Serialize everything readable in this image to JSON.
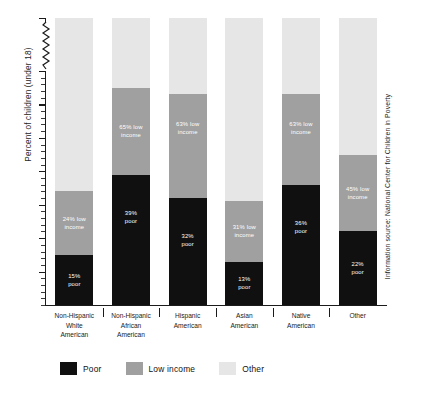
{
  "axis": {
    "y_title": "Percent of children (under 18)",
    "y_ticks": [
      "100%",
      "70%",
      "60%",
      "50%",
      "40%",
      "30%",
      "20%",
      "10%"
    ]
  },
  "legend": {
    "items": [
      {
        "label": "Poor",
        "color": "#101010",
        "key": "poor"
      },
      {
        "label": "Low income",
        "color": "#a0a0a0",
        "key": "low"
      },
      {
        "label": "Other",
        "color": "#e6e6e6",
        "key": "other"
      }
    ]
  },
  "source": {
    "text": "Information source: National Center for Children in Poverty"
  },
  "categories": [
    {
      "lines": [
        "Non-Hispanic",
        "White",
        "American"
      ]
    },
    {
      "lines": [
        "Non-Hispanic",
        "African",
        "American"
      ]
    },
    {
      "lines": [
        "Hispanic",
        "American"
      ]
    },
    {
      "lines": [
        "Asian",
        "American"
      ]
    },
    {
      "lines": [
        "Native",
        "American"
      ]
    },
    {
      "lines": [
        "Other"
      ]
    }
  ],
  "bar_labels": [
    {
      "poor": "15%\npoor",
      "low": "24% low\nincome"
    },
    {
      "poor": "39%\npoor",
      "low": "65% low\nincome"
    },
    {
      "poor": "32%\npoor",
      "low": "63% low\nincome"
    },
    {
      "poor": "13%\npoor",
      "low": "31% low\nincome"
    },
    {
      "poor": "36%\npoor",
      "low": "63% low\nincome"
    },
    {
      "poor": "22%\npoor",
      "low": "45% low\nincome"
    }
  ],
  "chart_data": {
    "type": "bar",
    "subtype": "stacked-bar",
    "title": "",
    "xlabel": "",
    "ylabel": "Percent of children (under 18)",
    "ylim": [
      0,
      100
    ],
    "y_axis_break": {
      "between": [
        70,
        100
      ],
      "style": "zigzag"
    },
    "grid": false,
    "legend_position": "bottom-left",
    "categories": [
      "Non-Hispanic White American",
      "Non-Hispanic African American",
      "Hispanic American",
      "Asian American",
      "Native American",
      "Other"
    ],
    "series": [
      {
        "name": "Poor",
        "color": "#101010",
        "values": [
          15,
          39,
          32,
          13,
          36,
          22
        ]
      },
      {
        "name": "Low income",
        "color": "#a0a0a0",
        "values": [
          19,
          26,
          31,
          18,
          27,
          23
        ]
      },
      {
        "name": "Other",
        "color": "#e6e6e6",
        "values": [
          66,
          35,
          37,
          69,
          37,
          55
        ]
      }
    ],
    "cumulative_low_income": [
      34,
      65,
      63,
      31,
      63,
      45
    ],
    "annotations": [
      {
        "category": "Non-Hispanic White American",
        "segment": "Poor",
        "text": "15% poor"
      },
      {
        "category": "Non-Hispanic White American",
        "segment": "Low income",
        "text": "24% low income"
      },
      {
        "category": "Non-Hispanic African American",
        "segment": "Poor",
        "text": "39% poor"
      },
      {
        "category": "Non-Hispanic African American",
        "segment": "Low income",
        "text": "65% low income"
      },
      {
        "category": "Hispanic American",
        "segment": "Poor",
        "text": "32% poor"
      },
      {
        "category": "Hispanic American",
        "segment": "Low income",
        "text": "63% low income"
      },
      {
        "category": "Asian American",
        "segment": "Poor",
        "text": "13% poor"
      },
      {
        "category": "Asian American",
        "segment": "Low income",
        "text": "31% low income"
      },
      {
        "category": "Native American",
        "segment": "Poor",
        "text": "36% poor"
      },
      {
        "category": "Native American",
        "segment": "Low income",
        "text": "63% low income"
      },
      {
        "category": "Other",
        "segment": "Poor",
        "text": "22% poor"
      },
      {
        "category": "Other",
        "segment": "Low income",
        "text": "45% low income"
      }
    ],
    "source_note": "Information source: National Center for Children in Poverty"
  }
}
